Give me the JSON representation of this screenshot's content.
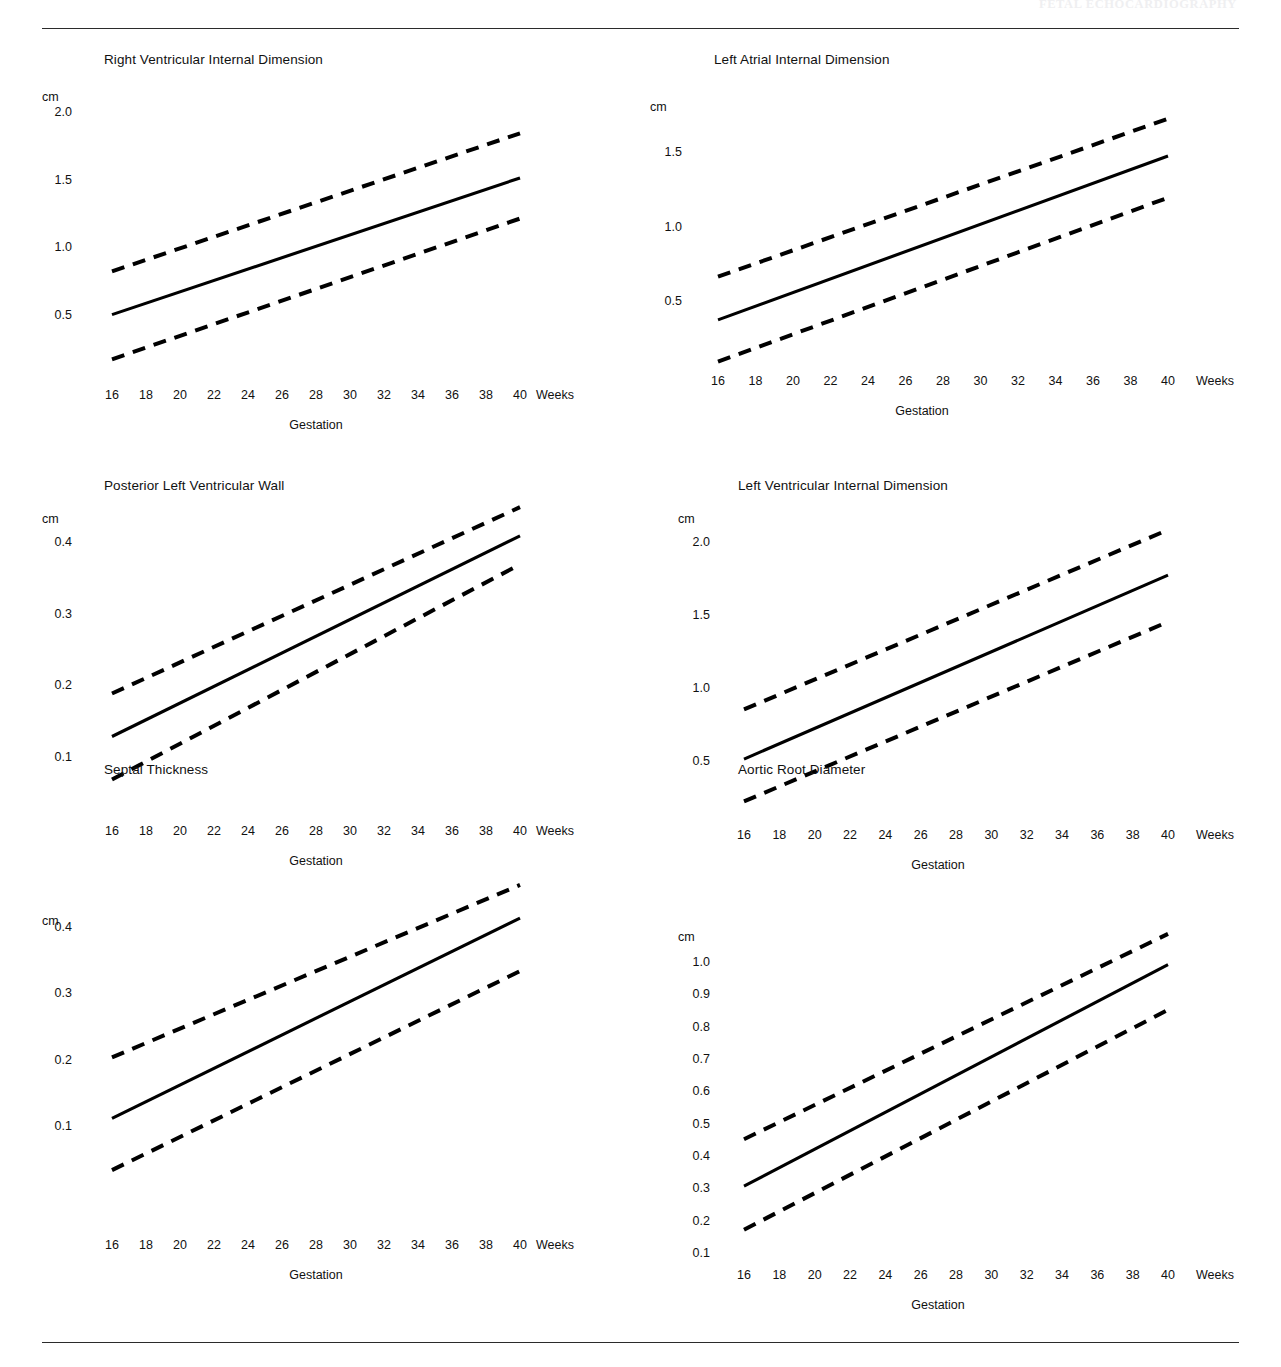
{
  "document": {
    "running_header": "FETAL ECHOCARDIOGRAPHY",
    "rules": {
      "top": "horizontal-rule",
      "bottom": "horizontal-rule"
    }
  },
  "axis_common": {
    "y_unit": "cm",
    "x_unit": "Weeks",
    "x_caption": "Gestation",
    "x_ticks": [
      "16",
      "18",
      "20",
      "22",
      "24",
      "26",
      "28",
      "30",
      "32",
      "34",
      "36",
      "38",
      "40"
    ]
  },
  "chart_data": [
    {
      "type": "line",
      "title": "Right Ventricular Internal Dimension",
      "xlabel": "Gestation",
      "ylabel": "cm",
      "x_unit": "Weeks",
      "x": [
        16,
        40
      ],
      "xlim": [
        16,
        40
      ],
      "ylim": [
        0.1,
        2.1
      ],
      "y_ticks": [
        "2.0",
        "1.5",
        "1.0",
        "0.5"
      ],
      "y_tick_values": [
        2.0,
        1.5,
        1.0,
        0.5
      ],
      "grid": false,
      "legend": "none",
      "series": [
        {
          "name": "Upper limit (+2 SD)",
          "style": "dashed",
          "values": [
            0.83,
            1.85
          ]
        },
        {
          "name": "Mean",
          "style": "solid",
          "values": [
            0.51,
            1.52
          ]
        },
        {
          "name": "Lower limit (-2 SD)",
          "style": "dashed",
          "values": [
            0.18,
            1.22
          ]
        }
      ]
    },
    {
      "type": "line",
      "title": "Left Atrial Internal Dimension",
      "xlabel": "Gestation",
      "ylabel": "cm",
      "x_unit": "Weeks",
      "x": [
        16,
        40
      ],
      "xlim": [
        16,
        40
      ],
      "ylim": [
        0.05,
        1.85
      ],
      "y_ticks": [
        "1.5",
        "1.0",
        "0.5"
      ],
      "y_tick_values": [
        1.5,
        1.0,
        0.5
      ],
      "grid": false,
      "legend": "none",
      "series": [
        {
          "name": "Upper limit (+2 SD)",
          "style": "dashed",
          "values": [
            0.67,
            1.73
          ]
        },
        {
          "name": "Mean",
          "style": "solid",
          "values": [
            0.38,
            1.48
          ]
        },
        {
          "name": "Lower limit (-2 SD)",
          "style": "dashed",
          "values": [
            0.1,
            1.2
          ]
        }
      ]
    },
    {
      "type": "line",
      "title": "Posterior Left Ventricular Wall",
      "xlabel": "Gestation",
      "ylabel": "cm",
      "x_unit": "Weeks",
      "x": [
        16,
        40
      ],
      "xlim": [
        16,
        40
      ],
      "ylim": [
        0.05,
        0.47
      ],
      "y_ticks": [
        "0.4",
        "0.3",
        "0.2",
        "0.1"
      ],
      "y_tick_values": [
        0.4,
        0.3,
        0.2,
        0.1
      ],
      "grid": false,
      "legend": "none",
      "series": [
        {
          "name": "Upper limit (+2 SD)",
          "style": "dashed",
          "values": [
            0.19,
            0.45
          ]
        },
        {
          "name": "Mean",
          "style": "solid",
          "values": [
            0.13,
            0.41
          ]
        },
        {
          "name": "Lower limit (-2 SD)",
          "style": "dashed",
          "values": [
            0.07,
            0.37
          ]
        }
      ]
    },
    {
      "type": "line",
      "title": "Left Ventricular Internal Dimension",
      "xlabel": "Gestation",
      "ylabel": "cm",
      "x_unit": "Weeks",
      "x": [
        16,
        40
      ],
      "xlim": [
        16,
        40
      ],
      "ylim": [
        0.15,
        2.2
      ],
      "y_ticks": [
        "2.0",
        "1.5",
        "1.0",
        "0.5"
      ],
      "y_tick_values": [
        2.0,
        1.5,
        1.0,
        0.5
      ],
      "grid": false,
      "legend": "none",
      "series": [
        {
          "name": "Upper limit (+2 SD)",
          "style": "dashed",
          "values": [
            0.86,
            2.09
          ]
        },
        {
          "name": "Mean",
          "style": "solid",
          "values": [
            0.52,
            1.78
          ]
        },
        {
          "name": "Lower limit (-2 SD)",
          "style": "dashed",
          "values": [
            0.23,
            1.46
          ]
        }
      ]
    },
    {
      "type": "line",
      "title": "Septal Thickness",
      "xlabel": "Gestation",
      "ylabel": "cm",
      "x_unit": "Weeks",
      "x": [
        16,
        40
      ],
      "xlim": [
        16,
        40
      ],
      "ylim": [
        0.03,
        0.48
      ],
      "y_ticks": [
        "0.4",
        "0.3",
        "0.2",
        "0.1"
      ],
      "y_tick_values": [
        0.4,
        0.3,
        0.2,
        0.1
      ],
      "grid": false,
      "legend": "none",
      "series": [
        {
          "name": "Upper limit (+2 SD)",
          "style": "dashed",
          "values": [
            0.205,
            0.465
          ]
        },
        {
          "name": "Mean",
          "style": "solid",
          "values": [
            0.113,
            0.415
          ]
        },
        {
          "name": "Lower limit (-2 SD)",
          "style": "dashed",
          "values": [
            0.035,
            0.335
          ]
        }
      ]
    },
    {
      "type": "line",
      "title": "Aortic Root Diameter",
      "xlabel": "Gestation",
      "ylabel": "cm",
      "x_unit": "Weeks",
      "x": [
        16,
        40
      ],
      "xlim": [
        16,
        40
      ],
      "ylim": [
        0.1,
        1.12
      ],
      "y_ticks": [
        "1.0",
        "0.9",
        "0.8",
        "0.7",
        "0.6",
        "0.5",
        "0.4",
        "0.3",
        "0.2",
        "0.1"
      ],
      "y_tick_values": [
        1.0,
        0.9,
        0.8,
        0.7,
        0.6,
        0.5,
        0.4,
        0.3,
        0.2,
        0.1
      ],
      "grid": false,
      "legend": "none",
      "series": [
        {
          "name": "Upper limit (+2 SD)",
          "style": "dashed",
          "values": [
            0.455,
            1.09
          ]
        },
        {
          "name": "Mean",
          "style": "solid",
          "values": [
            0.31,
            0.995
          ]
        },
        {
          "name": "Lower limit (-2 SD)",
          "style": "dashed",
          "values": [
            0.175,
            0.855
          ]
        }
      ]
    }
  ],
  "layout": {
    "panels": [
      {
        "left": 0,
        "top": 40,
        "title_x": 104,
        "title_y": 52,
        "unit_x": 42,
        "unit_y": 90,
        "ytick_right": 72,
        "plot_x0": 112,
        "plot_x1": 520,
        "y_px": {
          "min_val": 0.5,
          "min_px": 316,
          "max_val": 2.0,
          "max_px": 113
        },
        "xtick_y": 388,
        "xunit_x": 536,
        "xcap_x": 316,
        "xcap_y": 418
      },
      {
        "left": 0,
        "top": 40,
        "title_x": 714,
        "title_y": 52,
        "unit_x": 650,
        "unit_y": 100,
        "ytick_right": 682,
        "plot_x0": 718,
        "plot_x1": 1168,
        "y_px": {
          "min_val": 0.5,
          "min_px": 302,
          "max_val": 1.5,
          "max_px": 153
        },
        "xtick_y": 374,
        "xunit_x": 1196,
        "xcap_x": 922,
        "xcap_y": 404
      },
      {
        "left": 0,
        "top": 0,
        "title_x": 104,
        "title_y": 478,
        "unit_x": 42,
        "unit_y": 512,
        "ytick_right": 72,
        "plot_x0": 112,
        "plot_x1": 520,
        "y_px": {
          "min_val": 0.1,
          "min_px": 758,
          "max_val": 0.4,
          "max_px": 543
        },
        "xtick_y": 824,
        "xunit_x": 536,
        "xcap_x": 316,
        "xcap_y": 854
      },
      {
        "left": 0,
        "top": 0,
        "title_x": 738,
        "title_y": 478,
        "unit_x": 678,
        "unit_y": 512,
        "ytick_right": 710,
        "plot_x0": 744,
        "plot_x1": 1168,
        "y_px": {
          "min_val": 0.5,
          "min_px": 762,
          "max_val": 2.0,
          "max_px": 543
        },
        "xtick_y": 828,
        "xunit_x": 1196,
        "xcap_x": 938,
        "xcap_y": 858
      },
      {
        "left": 0,
        "top": 0,
        "title_x": 104,
        "title_y": 762,
        "unit_x": 42,
        "unit_y": 914,
        "ytick_right": 72,
        "plot_x0": 112,
        "plot_x1": 520,
        "y_px": {
          "min_val": 0.1,
          "min_px": 1127,
          "max_val": 0.4,
          "max_px": 928
        },
        "xtick_y": 1238,
        "xunit_x": 536,
        "xcap_x": 316,
        "xcap_y": 1268
      },
      {
        "left": 0,
        "top": 0,
        "title_x": 738,
        "title_y": 762,
        "unit_x": 678,
        "unit_y": 930,
        "ytick_right": 710,
        "plot_x0": 744,
        "plot_x1": 1168,
        "y_px": {
          "min_val": 0.1,
          "min_px": 1254,
          "max_val": 1.0,
          "max_px": 963
        },
        "xtick_y": 1268,
        "xunit_x": 1196,
        "xcap_x": 938,
        "xcap_y": 1298
      }
    ]
  }
}
